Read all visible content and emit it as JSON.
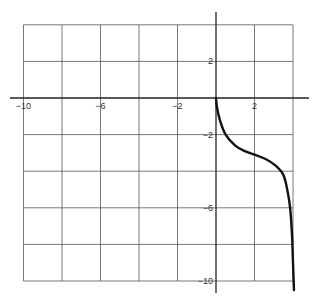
{
  "chart_data": {
    "type": "line",
    "title": "",
    "xlabel": "",
    "ylabel": "",
    "xlim": [
      -10,
      4
    ],
    "ylim": [
      -10,
      4
    ],
    "grid": true,
    "x_ticks": [
      -10,
      -8,
      -6,
      -4,
      -2,
      0,
      2,
      4
    ],
    "y_ticks": [
      4,
      2,
      0,
      -2,
      -4,
      -6,
      -8,
      -10
    ],
    "x_tick_labels": [
      {
        "value": -10,
        "label": "−10"
      },
      {
        "value": -6,
        "label": "−6"
      },
      {
        "value": -2,
        "label": "−2"
      },
      {
        "value": 2,
        "label": "2"
      }
    ],
    "y_tick_labels": [
      {
        "value": 2,
        "label": "2"
      },
      {
        "value": -2,
        "label": "−2"
      },
      {
        "value": -6,
        "label": "−6"
      },
      {
        "value": -10,
        "label": "−10"
      }
    ],
    "series": [
      {
        "name": "curve",
        "color": "#111111",
        "points": [
          [
            0,
            0
          ],
          [
            0.05,
            -0.5
          ],
          [
            0.2,
            -1.2
          ],
          [
            0.5,
            -2.0
          ],
          [
            1.0,
            -2.6
          ],
          [
            1.5,
            -2.9
          ],
          [
            2.0,
            -3.1
          ],
          [
            2.6,
            -3.35
          ],
          [
            3.1,
            -3.7
          ],
          [
            3.5,
            -4.2
          ],
          [
            3.7,
            -5.0
          ],
          [
            3.85,
            -6.0
          ],
          [
            3.95,
            -7.5
          ],
          [
            4.0,
            -9.0
          ],
          [
            4.05,
            -10.5
          ]
        ]
      }
    ]
  }
}
